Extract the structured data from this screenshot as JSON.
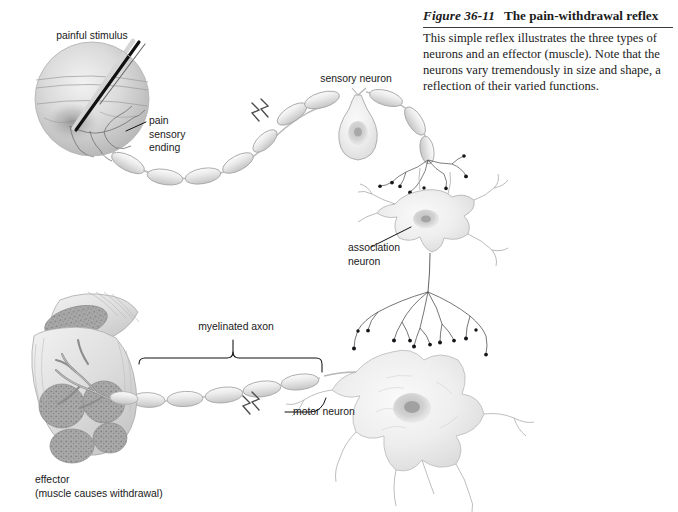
{
  "figure": {
    "number": "Figure 36-11",
    "title": "The pain-withdrawal reflex",
    "body": "This simple reflex illustrates the three types of neurons and an effector (muscle). Note that the neurons vary tremendously in size and shape, a reflection of their varied functions."
  },
  "labels": {
    "painful_stimulus": "painful stimulus",
    "pain_sensory_ending": "pain\nsensory\nending",
    "sensory_neuron": "sensory neuron",
    "association_neuron": "association\nneuron",
    "myelinated_axon": "myelinated axon",
    "motor_neuron": "motor neuron",
    "effector": "effector\n(muscle causes withdrawal)"
  },
  "colors": {
    "page_background": "#ffffff",
    "text": "#1a1a1a",
    "caption_text": "#1b1b1b",
    "rule": "#3a3a3a",
    "leader_line": "#111111",
    "illustration_outline": "#8e8e8e",
    "illustration_fill_light": "#e9e9e9",
    "illustration_fill_mid": "#cfcfcf",
    "illustration_fill_dark": "#9a9a9a",
    "synapse_bouton": "#15151a",
    "needle_dark": "#0d0d0d",
    "needle_light": "#f2f2f2"
  },
  "diagram": {
    "type": "labeled-biological-illustration",
    "pathway_order": [
      "painful stimulus",
      "pain sensory ending",
      "sensory neuron",
      "association neuron",
      "motor neuron",
      "effector (muscle causes withdrawal)"
    ],
    "elements": [
      {
        "name": "skin-circle-with-needle",
        "shape": "circle",
        "cx": 92,
        "cy": 99,
        "r": 57
      },
      {
        "name": "sensory-neuron-cell-body",
        "shape": "teardrop",
        "cx": 358,
        "cy": 128
      },
      {
        "name": "association-neuron-soma",
        "shape": "multipolar",
        "cx": 425,
        "cy": 222
      },
      {
        "name": "motor-neuron-soma",
        "shape": "multipolar-large",
        "cx": 408,
        "cy": 405
      },
      {
        "name": "effector-muscle",
        "shape": "muscle-bundle",
        "cx": 72,
        "cy": 390
      }
    ],
    "axon_breaks": [
      {
        "x": 277,
        "y": 115
      },
      {
        "x": 253,
        "y": 404
      }
    ],
    "myelin_segment_counts": {
      "sensory_axon": 9,
      "motor_axon": 5
    }
  }
}
